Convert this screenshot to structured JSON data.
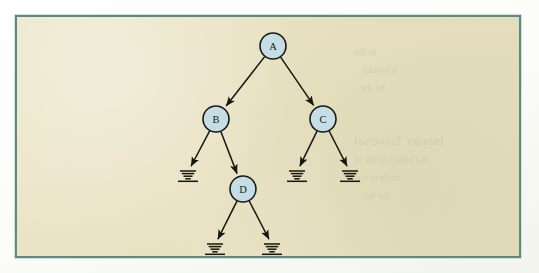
{
  "figure": {
    "kind": "binary-tree-diagram",
    "caption": "",
    "frame": {
      "x": 15,
      "y": 15,
      "width": 506,
      "height": 243,
      "border_color": "#5d8a85",
      "background_color": "#e9e3c4"
    },
    "page_background_color": "#fdfdfb"
  },
  "style": {
    "node_fill": "#c5dde4",
    "node_stroke": "#1a1a1a",
    "edge_color": "#17170f",
    "label_color": "#1a1a1a",
    "node_radius": 13
  },
  "chart_data": {
    "type": "diagram",
    "title": "",
    "nodes": [
      {
        "id": "A",
        "label": "A",
        "x": 273,
        "y": 46,
        "level": 0
      },
      {
        "id": "B",
        "label": "B",
        "x": 216,
        "y": 119,
        "level": 1
      },
      {
        "id": "C",
        "label": "C",
        "x": 323,
        "y": 119,
        "level": 1
      },
      {
        "id": "D",
        "label": "D",
        "x": 243,
        "y": 189,
        "level": 2
      }
    ],
    "null_leaves": [
      {
        "id": "N1",
        "x": 188,
        "y": 172,
        "parent": "B",
        "side": "left"
      },
      {
        "id": "N2",
        "x": 297,
        "y": 172,
        "parent": "C",
        "side": "left"
      },
      {
        "id": "N3",
        "x": 350,
        "y": 172,
        "parent": "C",
        "side": "right"
      },
      {
        "id": "N4",
        "x": 215,
        "y": 245,
        "parent": "D",
        "side": "left"
      },
      {
        "id": "N5",
        "x": 272,
        "y": 245,
        "parent": "D",
        "side": "right"
      }
    ],
    "edges": [
      {
        "from": "A",
        "to": "B",
        "arrow": true
      },
      {
        "from": "A",
        "to": "C",
        "arrow": true
      },
      {
        "from": "B",
        "to": "N1",
        "arrow": true
      },
      {
        "from": "B",
        "to": "D",
        "arrow": true
      },
      {
        "from": "C",
        "to": "N2",
        "arrow": true
      },
      {
        "from": "C",
        "to": "N3",
        "arrow": true
      },
      {
        "from": "D",
        "to": "N4",
        "arrow": true
      },
      {
        "from": "D",
        "to": "N5",
        "arrow": true
      }
    ],
    "legend": [],
    "annotations": []
  },
  "ghost_text": [
    {
      "text": "Inorder Traversal",
      "x": 352,
      "y": 131,
      "size": 13
    },
    {
      "text": "the nodes of the bi",
      "x": 352,
      "y": 152,
      "size": 10
    },
    {
      "text": "node is visi",
      "x": 352,
      "y": 170,
      "size": 10
    },
    {
      "text": "the left",
      "x": 360,
      "y": 188,
      "size": 10
    },
    {
      "text": "in the",
      "x": 352,
      "y": 44,
      "size": 10
    },
    {
      "text": "traversal",
      "x": 360,
      "y": 62,
      "size": 10
    },
    {
      "text": "by the",
      "x": 358,
      "y": 80,
      "size": 10
    }
  ]
}
